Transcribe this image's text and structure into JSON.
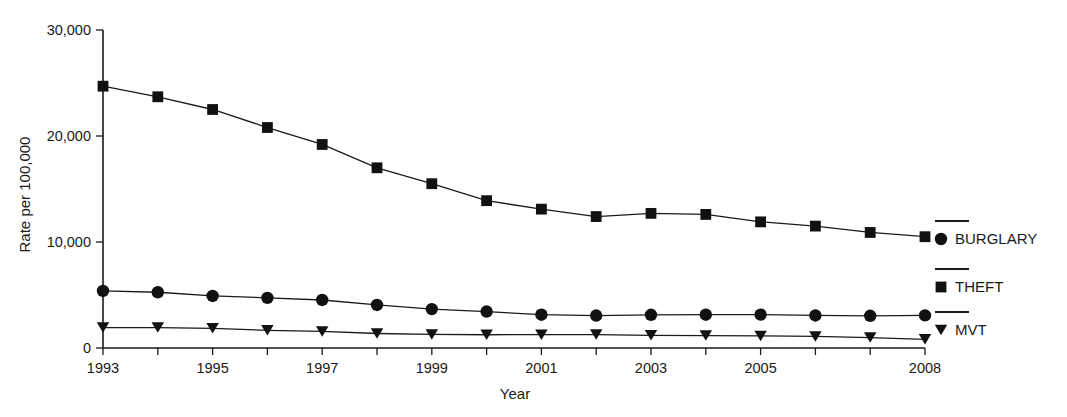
{
  "chart_data": {
    "type": "line",
    "title": "",
    "xlabel": "Year",
    "ylabel": "Rate per 100,000",
    "x": [
      1993,
      1994,
      1995,
      1996,
      1997,
      1998,
      1999,
      2000,
      2001,
      2002,
      2003,
      2004,
      2005,
      2006,
      2007,
      2008
    ],
    "xlim": [
      1993,
      2008
    ],
    "ylim": [
      0,
      30000
    ],
    "xticks": [
      1993,
      1994,
      1995,
      1996,
      1997,
      1998,
      1999,
      2000,
      2001,
      2002,
      2003,
      2004,
      2005,
      2006,
      2007,
      2008
    ],
    "xtick_labels": [
      "1993",
      "",
      "1995",
      "",
      "1997",
      "",
      "1999",
      "",
      "2001",
      "",
      "2003",
      "",
      "2005",
      "",
      "",
      "2008"
    ],
    "yticks": [
      0,
      10000,
      20000,
      30000
    ],
    "ytick_labels": [
      "0",
      "10,000",
      "20,000",
      "30,000"
    ],
    "grid": false,
    "legend_position": "right",
    "series": [
      {
        "name": "BURGLARY",
        "marker": "circle",
        "color": "#111111",
        "values": [
          5380,
          5260,
          4910,
          4730,
          4530,
          4060,
          3670,
          3440,
          3140,
          3060,
          3130,
          3140,
          3150,
          3070,
          3040,
          3080
        ]
      },
      {
        "name": "THEFT",
        "marker": "square",
        "color": "#111111",
        "values": [
          24700,
          23700,
          22500,
          20800,
          19200,
          17000,
          15500,
          13900,
          13100,
          12400,
          12700,
          12600,
          11900,
          11500,
          10900,
          10500
        ]
      },
      {
        "name": "MVT",
        "marker": "triangle-down",
        "color": "#111111",
        "values": [
          1930,
          1930,
          1860,
          1670,
          1560,
          1370,
          1280,
          1250,
          1260,
          1270,
          1200,
          1170,
          1140,
          1090,
          980,
          820
        ]
      }
    ]
  },
  "legend": {
    "items": [
      {
        "label": "BURGLARY",
        "marker": "circle"
      },
      {
        "label": "THEFT",
        "marker": "square"
      },
      {
        "label": "MVT",
        "marker": "triangle-down"
      }
    ]
  }
}
